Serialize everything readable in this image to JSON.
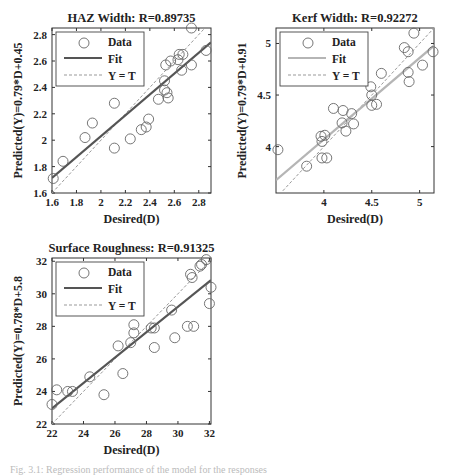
{
  "figure": {
    "caption": "Fig. 3.1: Regression performance of the model for the responses"
  },
  "chart_data": [
    {
      "type": "scatter",
      "title": "HAZ Width: R=0.89735",
      "xlabel": "Desired(D)",
      "ylabel": "Predicted(Y)=0.79*D+0.45",
      "xlim": [
        1.6,
        2.9
      ],
      "ylim": [
        1.6,
        2.85
      ],
      "xticks": [
        1.6,
        1.8,
        2,
        2.2,
        2.4,
        2.6,
        2.8
      ],
      "xtick_labels": [
        "1.6",
        "1.8",
        "2",
        "2.2",
        "2.4",
        "2.6",
        "2.8"
      ],
      "yticks": [
        1.6,
        1.8,
        2,
        2.2,
        2.4,
        2.6,
        2.8
      ],
      "ytick_labels": [
        "1.6",
        "1.8",
        "2",
        "2.2",
        "2.4",
        "2.6",
        "2.8"
      ],
      "fit": {
        "slope": 0.79,
        "intercept": 0.45,
        "color": "#555555"
      },
      "legend": [
        "Data",
        "Fit",
        "Y = T"
      ],
      "legend_position": "upper left",
      "grid": false,
      "points": [
        [
          1.61,
          1.71
        ],
        [
          1.69,
          1.84
        ],
        [
          1.87,
          2.02
        ],
        [
          1.93,
          2.13
        ],
        [
          2.11,
          2.28
        ],
        [
          2.11,
          1.94
        ],
        [
          2.24,
          2.01
        ],
        [
          2.33,
          2.08
        ],
        [
          2.37,
          2.1
        ],
        [
          2.39,
          2.16
        ],
        [
          2.47,
          2.31
        ],
        [
          2.52,
          2.38
        ],
        [
          2.52,
          2.45
        ],
        [
          2.53,
          2.57
        ],
        [
          2.54,
          2.36
        ],
        [
          2.55,
          2.32
        ],
        [
          2.57,
          2.6
        ],
        [
          2.63,
          2.61
        ],
        [
          2.64,
          2.65
        ],
        [
          2.66,
          2.53
        ],
        [
          2.67,
          2.65
        ],
        [
          2.74,
          2.85
        ],
        [
          2.74,
          2.57
        ],
        [
          2.86,
          2.68
        ]
      ]
    },
    {
      "type": "scatter",
      "title": "Kerf Width: R=0.92272",
      "xlabel": "Desired(D)",
      "ylabel": "Predicted(Y)=0.79*D+0.91",
      "xlim": [
        3.5,
        5.15
      ],
      "ylim": [
        3.55,
        5.15
      ],
      "xticks": [
        4,
        4.5,
        5
      ],
      "xtick_labels": [
        "4",
        "4.5",
        "5"
      ],
      "yticks": [
        4,
        4.5,
        5
      ],
      "ytick_labels": [
        "4",
        "4.5",
        "5"
      ],
      "fit": {
        "slope": 0.79,
        "intercept": 0.91,
        "color": "#b5b5b5"
      },
      "legend": [
        "Data",
        "Fit",
        "Y = T"
      ],
      "legend_position": "upper left",
      "grid": false,
      "points": [
        [
          3.52,
          3.97
        ],
        [
          3.82,
          3.81
        ],
        [
          3.97,
          4.1
        ],
        [
          3.98,
          4.05
        ],
        [
          3.98,
          3.89
        ],
        [
          4.01,
          4.11
        ],
        [
          4.03,
          3.89
        ],
        [
          4.1,
          4.37
        ],
        [
          4.19,
          4.23
        ],
        [
          4.2,
          4.35
        ],
        [
          4.23,
          4.15
        ],
        [
          4.29,
          4.32
        ],
        [
          4.31,
          4.22
        ],
        [
          4.49,
          4.58
        ],
        [
          4.5,
          4.5
        ],
        [
          4.5,
          4.4
        ],
        [
          4.55,
          4.41
        ],
        [
          4.6,
          4.71
        ],
        [
          4.84,
          4.96
        ],
        [
          4.88,
          4.92
        ],
        [
          4.88,
          4.72
        ],
        [
          4.89,
          4.63
        ],
        [
          4.94,
          5.1
        ],
        [
          5.03,
          4.79
        ],
        [
          5.14,
          4.92
        ]
      ]
    },
    {
      "type": "scatter",
      "title": "Surface Roughness: R=0.91325",
      "xlabel": "Desired(D)",
      "ylabel": "Predicted(Y)=0.78*D+5.8",
      "xlim": [
        22,
        32.1
      ],
      "ylim": [
        22,
        32.2
      ],
      "xticks": [
        22,
        24,
        26,
        28,
        30,
        32
      ],
      "xtick_labels": [
        "22",
        "24",
        "26",
        "28",
        "30",
        "32"
      ],
      "yticks": [
        22,
        24,
        26,
        28,
        30,
        32
      ],
      "ytick_labels": [
        "22",
        "24",
        "26",
        "28",
        "30",
        "32"
      ],
      "fit": {
        "slope": 0.78,
        "intercept": 5.8,
        "color": "#555555"
      },
      "legend": [
        "Data",
        "Fit",
        "Y = T"
      ],
      "legend_position": "upper left",
      "grid": false,
      "points": [
        [
          22.0,
          23.2
        ],
        [
          22.3,
          24.1
        ],
        [
          23.0,
          24.0
        ],
        [
          23.3,
          24.0
        ],
        [
          24.4,
          24.9
        ],
        [
          25.3,
          23.8
        ],
        [
          26.2,
          26.8
        ],
        [
          26.5,
          25.1
        ],
        [
          27.0,
          27.0
        ],
        [
          27.2,
          27.6
        ],
        [
          27.2,
          28.1
        ],
        [
          28.3,
          27.9
        ],
        [
          28.5,
          27.9
        ],
        [
          28.5,
          26.7
        ],
        [
          29.6,
          29.0
        ],
        [
          29.8,
          27.3
        ],
        [
          30.6,
          28.0
        ],
        [
          30.8,
          31.2
        ],
        [
          30.9,
          31.0
        ],
        [
          31.0,
          28.0
        ],
        [
          31.4,
          31.7
        ],
        [
          31.5,
          31.8
        ],
        [
          31.8,
          32.1
        ],
        [
          32.0,
          29.4
        ],
        [
          32.1,
          30.4
        ]
      ]
    }
  ]
}
